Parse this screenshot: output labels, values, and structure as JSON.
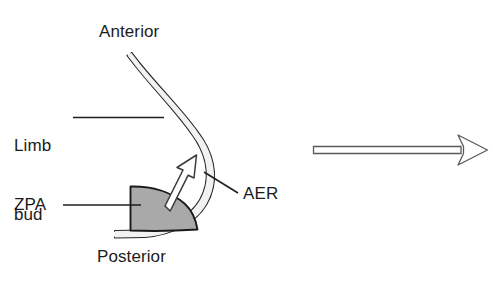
{
  "figure": {
    "type": "biological-diagram",
    "background_color": "#ffffff",
    "width": 493,
    "height": 286
  },
  "labels": {
    "anterior": "Anterior",
    "posterior": "Posterior",
    "limb_bud_line1": "Limb",
    "limb_bud_line2": "bud",
    "zpa": "ZPA",
    "aer": "AER"
  },
  "structures": {
    "aer_ridge": {
      "name": "apical ectodermal ridge",
      "style": "double outline curve",
      "stroke_color": "#262626"
    },
    "zpa_region": {
      "name": "zone of polarizing activity",
      "fill_color": "#a9a9a9",
      "stroke_color": "#1a1a1a",
      "shape": "half dome"
    },
    "signal_arrow": {
      "name": "ZPA signal arrow",
      "style": "outlined arrow",
      "direction": "up-right",
      "stroke_color": "#333333"
    },
    "transition_arrow": {
      "name": "stage transition arrow",
      "style": "long outlined arrow",
      "direction": "right",
      "stroke_color": "#4a4a4a"
    }
  },
  "leaders": {
    "limb_bud_leader": "horizontal leader line",
    "zpa_leader": "horizontal leader line",
    "aer_leader": "diagonal leader line"
  }
}
